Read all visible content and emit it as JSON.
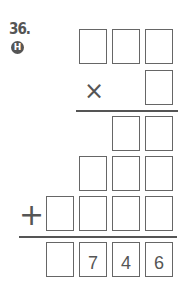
{
  "problem": {
    "number": "36.",
    "badge": "H"
  },
  "operators": {
    "multiply": "×",
    "add": "+"
  },
  "rows": {
    "multiplicand": [
      "",
      "",
      ""
    ],
    "multiplier": [
      ""
    ],
    "partial1": [
      "",
      ""
    ],
    "partial2": [
      "",
      "",
      ""
    ],
    "partial3": [
      "",
      "",
      "",
      ""
    ],
    "result": [
      "",
      "7",
      "4",
      "6"
    ]
  },
  "colors": {
    "ink": "#555555",
    "box_border": "#666666"
  }
}
